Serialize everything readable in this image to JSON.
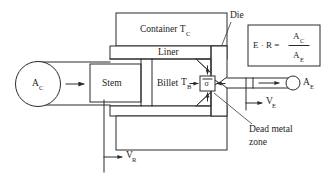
{
  "diagram": {
    "labels": {
      "container": "Container T",
      "container_sub": "C",
      "liner": "Liner",
      "stem": "Stem",
      "billet": "Billet",
      "die": "Die",
      "dead_metal_line1": "Dead metal",
      "dead_metal_line2": "zone",
      "billet_temp": "T",
      "billet_temp_sub": "B",
      "stress": "σ",
      "area_container": "A",
      "area_container_sub": "C",
      "area_exit": "A",
      "area_exit_sub": "E",
      "velocity_ram": "V",
      "velocity_ram_sub": "R",
      "velocity_exit": "V",
      "velocity_exit_sub": "E"
    },
    "equation": {
      "lhs": "E · R =",
      "numerator": "A",
      "numerator_sub": "C",
      "denominator": "A",
      "denominator_sub": "E"
    },
    "colors": {
      "line": "#2b2b2b",
      "text": "#1d1d1d",
      "background": "#ffffff"
    }
  }
}
